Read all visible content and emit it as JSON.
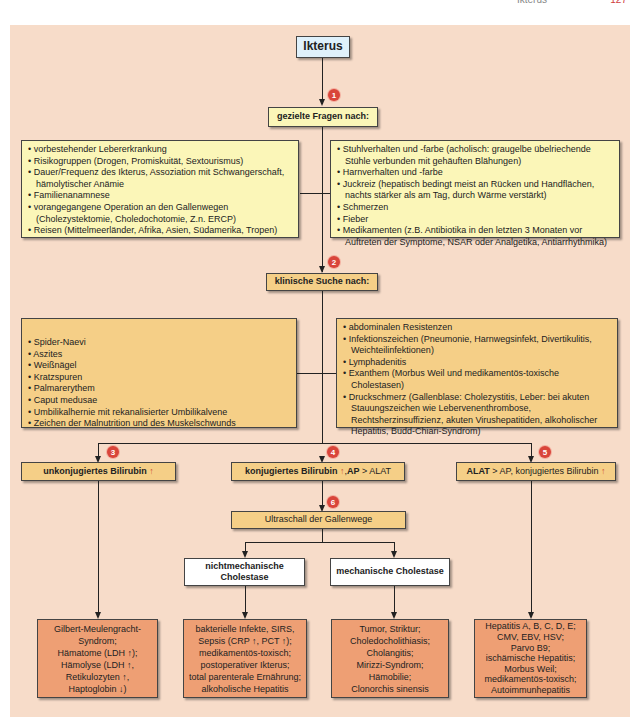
{
  "header": {
    "title": "Ikterus",
    "page": "127"
  },
  "title": "Ikterus",
  "steps": [
    {
      "num": "1",
      "label": "gezielte Fragen nach:"
    },
    {
      "num": "2",
      "label": "klinische Suche nach:"
    },
    {
      "num": "3"
    },
    {
      "num": "4"
    },
    {
      "num": "5"
    },
    {
      "num": "6",
      "label": "Ultraschall der Gallenwege"
    }
  ],
  "anamnesis_left": [
    "vorbestehender Lebererkrankung",
    "Risikogruppen (Drogen, Promiskuität, Sextourismus)",
    "Dauer/Frequenz des Ikterus, Assoziation mit Schwangerschaft, hämolytischer Anämie",
    "Familienanamnese",
    "vorangegangene Operation an den Gallenwegen (Cholezystektomie, Choledochotomie, Z.n. ERCP)",
    "Reisen (Mittelmeerländer, Afrika, Asien, Südamerika, Tropen)"
  ],
  "anamnesis_right": [
    "Stuhlverhalten und -farbe (acholisch: graugelbe übelriechende Stühle verbunden mit gehäuften Blähungen)",
    "Harnverhalten und -farbe",
    "Juckreiz (hepatisch bedingt meist an Rücken und Handflächen, nachts stärker als am Tag, durch Wärme verstärkt)",
    "Schmerzen",
    "Fieber",
    "Medikamenten (z.B. Antibiotika in den letzten 3 Monaten vor Auftreten der Symptome, NSAR oder Analgetika, Antiarrhythmika)"
  ],
  "clinical_left": [
    "Spider-Naevi",
    "Aszites",
    "Weißnägel",
    "Kratzspuren",
    "Palmarerythem",
    "Caput medusae",
    "Umbilikalhernie mit rekanalisierter Umbilikalvene",
    "Zeichen der Malnutrition und des Muskelschwunds"
  ],
  "clinical_right": [
    "abdominalen Resistenzen",
    "Infektionszeichen (Pneumonie, Harnwegsinfekt, Divertikulitis, Weichteilinfektionen)",
    "Lymphadenitis",
    "Exanthem (Morbus Weil und medikamentös-toxische Cholestasen)",
    "Druckschmerz (Gallenblase: Cholezystitis, Leber: bei akuten Stauungszeichen wie Lebervenenthrombose, Rechtsherzinsuffizienz, akuten Virushepatitiden, alkoholischer Hepatitis, Budd-Chiari-Syndrom)"
  ],
  "branches": {
    "unconjugated": {
      "bold": "unkonjugiertes Bilirubin",
      "arrow": "↑"
    },
    "conjugated": {
      "bold1": "konjugiertes Bilirubin",
      "arrow": "↑",
      "sep": ", ",
      "bold2": "AP",
      "rest": " > ALAT"
    },
    "alat": {
      "bold": "ALAT",
      "rest": " > AP, konjugiertes Bilirubin ",
      "arrow": "↑"
    }
  },
  "cholestasis": {
    "nonmechanical": "nichtmechanische Cholestase",
    "mechanical": "mechanische Cholestase"
  },
  "results": {
    "unconjugated": [
      "Gilbert-Meulengracht-",
      "Syndrom;",
      "Hämatome (LDH ↑);",
      "Hämolyse (LDH ↑,",
      "Retikulozyten ↑,",
      "Haptoglobin ↓)"
    ],
    "nonmechanical": [
      "bakterielle Infekte, SIRS,",
      "Sepsis (CRP ↑, PCT ↑);",
      "medikamentös-toxisch;",
      "postoperativer Ikterus;",
      "total parenterale Ernährung;",
      "alkoholische Hepatitis"
    ],
    "mechanical": [
      "Tumor, Striktur;",
      "Choledocholithiasis;",
      "Cholangitis;",
      "Mirizzi-Syndrom;",
      "Hämobilie;",
      "Clonorchis sinensis"
    ],
    "hepatic": [
      "Hepatitis A, B, C, D, E;",
      "CMV, EBV, HSV;",
      "Parvo B9;",
      "ischämische Hepatitis;",
      "Morbus Weil;",
      "medikamentös-toxisch;",
      "Autoimmunhepatitis"
    ]
  },
  "colors": {
    "panel": "#f7dcc9",
    "yellow_box": "#fbf6b8",
    "tan_box": "#f5cf87",
    "salmon_box": "#ee9f74",
    "title_box": "#dff1fb",
    "badge": "#d9453a"
  }
}
